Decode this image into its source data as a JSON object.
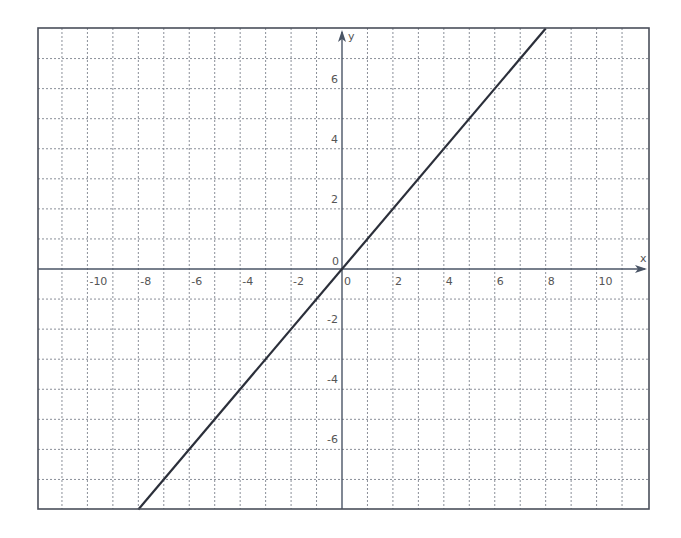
{
  "chart_data": {
    "type": "line",
    "title": "",
    "xlabel": "x",
    "ylabel": "y",
    "xlim": [
      -12,
      12
    ],
    "ylim": [
      -8,
      8
    ],
    "grid": true,
    "grid_style": "dotted",
    "x_ticks": [
      -10,
      -8,
      -6,
      -4,
      -2,
      0,
      2,
      4,
      6,
      8,
      10
    ],
    "x_tick_labels": [
      "-10",
      "-8",
      "-6",
      "-4",
      "-2",
      "0",
      "2",
      "4",
      "6",
      "8",
      "10"
    ],
    "y_ticks": [
      -6,
      -4,
      -2,
      0,
      2,
      4,
      6
    ],
    "y_tick_labels": [
      "-6",
      "-4",
      "-2",
      "0",
      "2",
      "4",
      "6"
    ],
    "series": [
      {
        "name": "y = x",
        "x": [
          -8,
          8
        ],
        "y": [
          -8,
          8
        ],
        "color": "#2b2f3a"
      }
    ]
  },
  "colors": {
    "frame": "#4a4f5a",
    "grid": "#8a8f98",
    "axis": "#4a5566",
    "line": "#2b2f3a",
    "text": "#555555"
  }
}
